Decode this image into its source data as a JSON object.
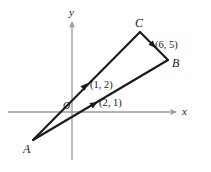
{
  "figure": {
    "type": "geometry-diagram",
    "width": 211,
    "height": 172,
    "background": "#ffffff",
    "axis_color": "#9a9a9a",
    "line_color": "#1a1a1a"
  },
  "axes": {
    "x_label": "x",
    "y_label": "y",
    "origin_label": "O",
    "x_axis": {
      "x1": 8,
      "y1": 112,
      "x2": 176,
      "y2": 112
    },
    "y_axis": {
      "x1": 72,
      "y1": 160,
      "x2": 72,
      "y2": 22
    }
  },
  "vertices": [
    {
      "name": "A",
      "label": "A",
      "px": 33,
      "py": 140,
      "label_x": 23,
      "label_y": 143
    },
    {
      "name": "B",
      "label": "B",
      "px": 168,
      "py": 60,
      "label_x": 172,
      "label_y": 57
    },
    {
      "name": "C",
      "label": "C",
      "px": 140,
      "py": 32,
      "label_x": 135,
      "label_y": 17
    }
  ],
  "vectors": [
    {
      "name": "vector-AC",
      "from": "A",
      "to": "C",
      "label": "(1, 2)",
      "label_x": 90,
      "label_y": 80,
      "arrow_x": 85,
      "arrow_y": 86
    },
    {
      "name": "vector-AB",
      "from": "A",
      "to": "B",
      "label": "(2, 1)",
      "label_x": 99,
      "label_y": 98,
      "arrow_x": 94,
      "arrow_y": 104
    },
    {
      "name": "vector-CB",
      "from": "C",
      "to": "B",
      "label": "(6, 5)",
      "label_x": 155,
      "label_y": 40,
      "arrow_x": 153,
      "arrow_y": 45
    }
  ],
  "chart_data": {
    "type": "scatter",
    "title": "",
    "xlabel": "x",
    "ylabel": "y",
    "grid": false,
    "legend": "none",
    "points": [
      {
        "name": "A",
        "label": "A"
      },
      {
        "name": "B",
        "label": "B"
      },
      {
        "name": "C",
        "label": "C"
      },
      {
        "name": "O",
        "label": "O"
      }
    ],
    "annotations": [
      "(1, 2)",
      "(2, 1)",
      "(6, 5)"
    ]
  }
}
